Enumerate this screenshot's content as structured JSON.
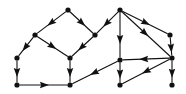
{
  "figure": {
    "name": "directed-graph-diagram",
    "type": "directed-graph",
    "title": "",
    "background_color": "#ffffff",
    "node_color": "#111111",
    "edge_color": "#111111",
    "width": 186,
    "height": 94,
    "node_radius": 2.6,
    "arrow_length": 9,
    "arrow_width": 6.5
  },
  "graph": {
    "node_count": 12,
    "edge_count": 16,
    "nodes": [
      {
        "id": "n1",
        "label": "",
        "x": 68,
        "y": 10
      },
      {
        "id": "n2",
        "label": "",
        "x": 120,
        "y": 10
      },
      {
        "id": "n3",
        "label": "",
        "x": 35,
        "y": 35
      },
      {
        "id": "n4",
        "label": "",
        "x": 95,
        "y": 35
      },
      {
        "id": "n5",
        "label": "",
        "x": 170,
        "y": 35
      },
      {
        "id": "n6",
        "label": "",
        "x": 17,
        "y": 58
      },
      {
        "id": "n7",
        "label": "",
        "x": 70,
        "y": 58
      },
      {
        "id": "n8",
        "label": "",
        "x": 120,
        "y": 60
      },
      {
        "id": "n9",
        "label": "",
        "x": 172,
        "y": 58
      },
      {
        "id": "n10",
        "label": "",
        "x": 17,
        "y": 85
      },
      {
        "id": "n11",
        "label": "",
        "x": 70,
        "y": 85
      },
      {
        "id": "n12",
        "label": "",
        "x": 120,
        "y": 85
      },
      {
        "id": "n13",
        "label": "",
        "x": 172,
        "y": 85
      }
    ],
    "edges": [
      {
        "from": "n1",
        "to": "n3",
        "directed": true,
        "arrow_at": 0.52
      },
      {
        "from": "n1",
        "to": "n4",
        "directed": true,
        "arrow_at": 0.52
      },
      {
        "from": "n3",
        "to": "n6",
        "directed": true,
        "arrow_at": 0.55
      },
      {
        "from": "n3",
        "to": "n7",
        "directed": true,
        "arrow_at": 0.5
      },
      {
        "from": "n4",
        "to": "n7",
        "directed": true,
        "arrow_at": 0.55
      },
      {
        "from": "n2",
        "to": "n4",
        "directed": true,
        "arrow_at": 0.55
      },
      {
        "from": "n2",
        "to": "n8",
        "directed": true,
        "arrow_at": 0.6
      },
      {
        "from": "n2",
        "to": "n5",
        "directed": true,
        "arrow_at": 0.52
      },
      {
        "from": "n2",
        "to": "n9",
        "directed": true,
        "arrow_at": 0.48
      },
      {
        "from": "n5",
        "to": "n9",
        "directed": true,
        "arrow_at": 0.6
      },
      {
        "from": "n6",
        "to": "n10",
        "directed": true,
        "arrow_at": 0.55
      },
      {
        "from": "n7",
        "to": "n11",
        "directed": true,
        "arrow_at": 0.55
      },
      {
        "from": "n8",
        "to": "n12",
        "directed": true,
        "arrow_at": 0.58
      },
      {
        "from": "n9",
        "to": "n13",
        "directed": true,
        "arrow_at": 0.58
      },
      {
        "from": "n10",
        "to": "n11",
        "directed": true,
        "arrow_at": 0.52
      },
      {
        "from": "n8",
        "to": "n11",
        "directed": true,
        "arrow_at": 0.52
      },
      {
        "from": "n9",
        "to": "n8",
        "directed": true,
        "arrow_at": 0.55
      },
      {
        "from": "n9",
        "to": "n12",
        "directed": true,
        "arrow_at": 0.5
      }
    ]
  }
}
